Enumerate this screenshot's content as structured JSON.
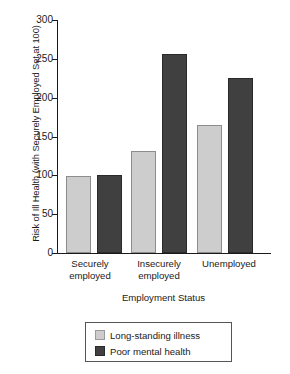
{
  "chart_data": {
    "type": "bar",
    "title": "",
    "xlabel": "Employment Status",
    "ylabel": "Risk of Ill Health (with Securely Employed Set at 100)",
    "categories": [
      "Securely employed",
      "Insecurely employed",
      "Unemployed"
    ],
    "series": [
      {
        "name": "Long-standing illness",
        "color": "#cdcdcd",
        "values": [
          99,
          131,
          165
        ]
      },
      {
        "name": "Poor mental health",
        "color": "#404040",
        "values": [
          100,
          256,
          225
        ]
      }
    ],
    "ylim": [
      0,
      300
    ],
    "yticks": [
      0,
      50,
      100,
      150,
      200,
      250,
      300
    ],
    "ytick_labels": [
      "0",
      "50",
      "100",
      "150",
      "200",
      "250",
      "300"
    ],
    "grid": false,
    "legend_position": "bottom-center"
  },
  "axes": {
    "y_title": "Risk of Ill Health (with Securely Employed Set at 100)",
    "x_title": "Employment Status"
  },
  "categories_wrapped": [
    {
      "line1": "Securely",
      "line2": "employed"
    },
    {
      "line1": "Insecurely",
      "line2": "employed"
    },
    {
      "line1": "Unemployed",
      "line2": ""
    }
  ],
  "legend": {
    "items": [
      {
        "label": "Long-standing illness",
        "color": "#cdcdcd"
      },
      {
        "label": "Poor mental health",
        "color": "#404040"
      }
    ]
  },
  "ticks": {
    "t0": "0",
    "t1": "50",
    "t2": "100",
    "t3": "150",
    "t4": "200",
    "t5": "250",
    "t6": "300"
  }
}
